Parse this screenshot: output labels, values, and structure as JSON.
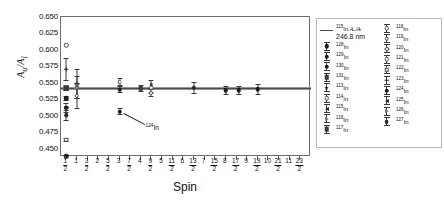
{
  "chart_data": {
    "type": "scatter",
    "title": "",
    "xlabel": "Spin",
    "ylabel": "A_u/A_l",
    "ylim": [
      0.4375,
      0.65
    ],
    "xlim": [
      0.25,
      12.0
    ],
    "yticks": [
      "0.450",
      "0.475",
      "0.500",
      "0.525",
      "0.550",
      "0.575",
      "0.600",
      "0.625",
      "0.650"
    ],
    "ytick_values": [
      0.45,
      0.475,
      0.5,
      0.525,
      0.55,
      0.575,
      0.6,
      0.625,
      0.65
    ],
    "xticks": [
      {
        "num": "1",
        "den": "2",
        "value": 0.5
      },
      {
        "num": "1",
        "den": "",
        "value": 1
      },
      {
        "num": "3",
        "den": "2",
        "value": 1.5
      },
      {
        "num": "2",
        "den": "",
        "value": 2
      },
      {
        "num": "5",
        "den": "2",
        "value": 2.5
      },
      {
        "num": "3",
        "den": "",
        "value": 3
      },
      {
        "num": "7",
        "den": "2",
        "value": 3.5
      },
      {
        "num": "4",
        "den": "",
        "value": 4
      },
      {
        "num": "9",
        "den": "2",
        "value": 4.5
      },
      {
        "num": "5",
        "den": "",
        "value": 5
      },
      {
        "num": "11",
        "den": "2",
        "value": 5.5
      },
      {
        "num": "6",
        "den": "",
        "value": 6
      },
      {
        "num": "13",
        "den": "2",
        "value": 6.5
      },
      {
        "num": "7",
        "den": "",
        "value": 7
      },
      {
        "num": "15",
        "den": "2",
        "value": 7.5
      },
      {
        "num": "8",
        "den": "",
        "value": 8
      },
      {
        "num": "17",
        "den": "2",
        "value": 8.5
      },
      {
        "num": "9",
        "den": "",
        "value": 9
      },
      {
        "num": "19",
        "den": "2",
        "value": 9.5
      },
      {
        "num": "10",
        "den": "",
        "value": 10
      },
      {
        "num": "21",
        "den": "2",
        "value": 10.5
      },
      {
        "num": "11",
        "den": "",
        "value": 11
      },
      {
        "num": "23",
        "den": "2",
        "value": 11.5
      }
    ],
    "grid": false,
    "legend_position": "right-outside",
    "reference_band": {
      "label": "115In A_u/A_l 246.8 nm",
      "value": 0.5415,
      "lower": 0.5385,
      "upper": 0.5445,
      "color": "#8c8c8c"
    },
    "annotations": [
      {
        "text": "124In",
        "x": 3.0,
        "y": 0.5065
      }
    ],
    "points": [
      {
        "label": "131In",
        "x": 0.5,
        "y": 0.6075,
        "yerr": 0.0,
        "marker": "open-circle"
      },
      {
        "label": "129In",
        "x": 0.5,
        "y": 0.5705,
        "yerr": 0.0175,
        "marker": "plus"
      },
      {
        "label": "119In",
        "x": 0.5,
        "y": 0.5425,
        "yerr": 0.0045,
        "marker": "open-square"
      },
      {
        "label": "121In",
        "x": 0.5,
        "y": 0.5415,
        "yerr": 0.0035,
        "marker": "filled-square"
      },
      {
        "label": "123In",
        "x": 0.5,
        "y": 0.5265,
        "yerr": 0.0035,
        "marker": "filled-circle"
      },
      {
        "label": "125In",
        "x": 0.5,
        "y": 0.5125,
        "yerr": 0.0075,
        "marker": "filled-circle"
      },
      {
        "label": "127In",
        "x": 0.5,
        "y": 0.501,
        "yerr": 0.0085,
        "marker": "filled-hex"
      },
      {
        "label": "130In",
        "x": 0.5,
        "y": 0.4635,
        "yerr": 0.0035,
        "marker": "open-circle"
      },
      {
        "label": "128In",
        "x": 0.5,
        "y": 0.4385,
        "yerr": 0.0,
        "marker": "filled-circle"
      },
      {
        "label": "120In",
        "x": 1.0,
        "y": 0.5485,
        "yerr": 0.0225,
        "marker": "open-diamond"
      },
      {
        "label": "122In",
        "x": 1.0,
        "y": 0.5425,
        "yerr": 0.0175,
        "marker": "open-square"
      },
      {
        "label": "118In",
        "x": 1.0,
        "y": 0.5305,
        "yerr": 0.0195,
        "marker": "open-circle"
      },
      {
        "label": "114In",
        "x": 3.0,
        "y": 0.5515,
        "yerr": 0.0065,
        "marker": "open-hex"
      },
      {
        "label": "116In",
        "x": 3.0,
        "y": 0.5395,
        "yerr": 0.0055,
        "marker": "filled-circle"
      },
      {
        "label": "124In",
        "x": 3.0,
        "y": 0.5065,
        "yerr": 0.0055,
        "marker": "filled-circle"
      },
      {
        "label": "126In",
        "x": 4.0,
        "y": 0.5415,
        "yerr": 0.0055,
        "marker": "filled-square"
      },
      {
        "label": "113In",
        "x": 4.5,
        "y": 0.5475,
        "yerr": 0.0065,
        "marker": "star"
      },
      {
        "label": "115In",
        "x": 4.5,
        "y": 0.5345,
        "yerr": 0.0055,
        "marker": "open-diamond"
      },
      {
        "label": "117In",
        "x": 4.5,
        "y": 0.5425,
        "yerr": 0.0,
        "marker": "open-circle"
      },
      {
        "label": "117In-b",
        "x": 6.5,
        "y": 0.5425,
        "yerr": 0.0095,
        "marker": "filled-hex"
      },
      {
        "label": "119In-b",
        "x": 8.0,
        "y": 0.5385,
        "yerr": 0.0075,
        "marker": "filled-circle"
      },
      {
        "label": "121In-b",
        "x": 8.6,
        "y": 0.5385,
        "yerr": 0.0075,
        "marker": "filled-circle"
      },
      {
        "label": "123In-b",
        "x": 9.5,
        "y": 0.5405,
        "yerr": 0.0085,
        "marker": "filled-circle"
      }
    ]
  },
  "legend": {
    "left_column": [
      {
        "symbol": "hline",
        "iso": "115",
        "element": "In",
        "suffix": " Aᵤ/Aₗ",
        "line2": "246.8 nm"
      },
      {
        "symbol": "filled-circle",
        "iso": "128",
        "element": "In"
      },
      {
        "symbol": "filled-circle",
        "iso": "129",
        "element": "In"
      },
      {
        "symbol": "filled-circle",
        "iso": "130",
        "element": "In"
      },
      {
        "symbol": "filled-square",
        "iso": "131",
        "element": "In"
      },
      {
        "symbol": "star",
        "iso": "113",
        "element": "In"
      },
      {
        "symbol": "open-circle",
        "iso": "114",
        "element": "In"
      },
      {
        "symbol": "filled-tri-left",
        "iso": "115",
        "element": "In"
      },
      {
        "symbol": "open-tri-right",
        "iso": "116",
        "element": "In"
      },
      {
        "symbol": "filled-square",
        "iso": "117",
        "element": "In"
      }
    ],
    "right_column": [
      {
        "symbol": "open-circle",
        "iso": "118",
        "element": "In"
      },
      {
        "symbol": "open-circle",
        "iso": "119",
        "element": "In"
      },
      {
        "symbol": "open-diamond",
        "iso": "120",
        "element": "In"
      },
      {
        "symbol": "open-circle",
        "iso": "121",
        "element": "In"
      },
      {
        "symbol": "open-square",
        "iso": "122",
        "element": "In"
      },
      {
        "symbol": "plus",
        "iso": "123",
        "element": "In"
      },
      {
        "symbol": "filled-circle",
        "iso": "124",
        "element": "In"
      },
      {
        "symbol": "filled-tri-left",
        "iso": "125",
        "element": "In"
      },
      {
        "symbol": "open-tri-right",
        "iso": "126",
        "element": "In"
      },
      {
        "symbol": "filled-hex",
        "iso": "127",
        "element": "In"
      }
    ]
  }
}
